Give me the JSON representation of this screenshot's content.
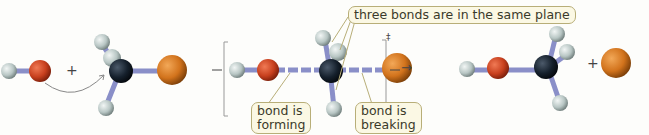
{
  "diagram": {
    "type": "SN2 reaction mechanism (ball-and-stick)",
    "labels": {
      "plane": "three bonds are in the same plane",
      "forming": "bond is forming",
      "forming_line1": "bond is",
      "forming_line2": "forming",
      "breaking": "bond is breaking",
      "breaking_line1": "bond is",
      "breaking_line2": "breaking"
    },
    "symbols": {
      "plus1": "+",
      "plus2": "+",
      "transition_state_mark": "‡",
      "arrow": "→",
      "dash": "—"
    },
    "stages": [
      {
        "name": "reactants",
        "species": [
          "hydroxide ion (H–O)",
          "methyl halide (CH3–X)"
        ]
      },
      {
        "name": "transition-state",
        "species": [
          "[HO···CH3···X]‡"
        ]
      },
      {
        "name": "products",
        "species": [
          "methanol (H–O–CH3)",
          "halide ion (X)"
        ]
      }
    ],
    "colors": {
      "oxygen": "#c8401e",
      "carbon": "#15202c",
      "halogen": "#d2731c",
      "hydrogen": "#c4d0ce",
      "bond": "#8a8fc8",
      "label_bg": "#fbf8e4",
      "label_border": "#b8ae78"
    }
  }
}
